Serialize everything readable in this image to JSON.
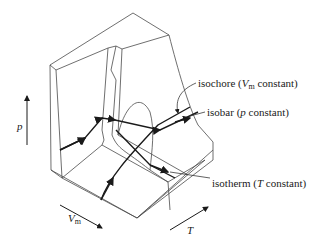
{
  "figure": {
    "type": "pVT surface diagram",
    "axes": {
      "pressure": "p",
      "molar_volume": "V",
      "molar_volume_subscript": "m",
      "temperature": "T"
    },
    "annotations": {
      "isochore": {
        "prefix": "isochore (",
        "var": "V",
        "sub": "m",
        "suffix": " constant)"
      },
      "isobar": {
        "prefix": "isobar (",
        "var": "p",
        "suffix": " constant)"
      },
      "isotherm": {
        "prefix": "isotherm (",
        "var": "T",
        "suffix": " constant)"
      }
    },
    "colors": {
      "line": "#3a3a3a",
      "bold_line": "#1a1a1a",
      "background": "#ffffff"
    }
  }
}
